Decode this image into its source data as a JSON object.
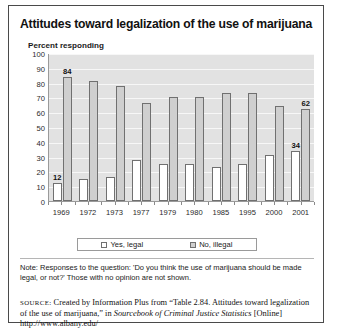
{
  "figure": {
    "title": "Attitudes toward legalization of the use of marijuana",
    "axis_title": "Percent responding",
    "note": "Note: Responses to the question: 'Do you think the use of marijuana should be made legal, or not?' Those with no opinion are not shown.",
    "source": {
      "label": "SOURCE:",
      "text_1": " Created by Information Plus from “Table 2.84. Attitudes toward legalization of the use of marijuana,” in ",
      "italic_1": "Sourcebook of Criminal Justice Statistics",
      "text_2": " [Online] http://www.albany.edu/"
    }
  },
  "legend": {
    "items": [
      {
        "label": "Yes, legal",
        "swatch": "white-square-icon",
        "color": "#ffffff"
      },
      {
        "label": "No, illegal",
        "swatch": "gray-square-icon",
        "color": "#cfcfcf"
      }
    ]
  },
  "chart_data": {
    "type": "bar",
    "title": "Attitudes toward legalization of the use of marijuana",
    "subtitle": "",
    "xlabel": "",
    "ylabel": "Percent responding",
    "ylim": [
      0,
      100
    ],
    "ytick_step": 10,
    "yticks": [
      0,
      10,
      20,
      30,
      40,
      50,
      60,
      70,
      80,
      90,
      100
    ],
    "grid": true,
    "legend_position": "bottom",
    "categories": [
      "1969",
      "1972",
      "1973",
      "1977",
      "1979",
      "1980",
      "1985",
      "1995",
      "2000",
      "2001"
    ],
    "series": [
      {
        "name": "Yes, legal",
        "color": "#ffffff",
        "values": [
          12,
          15,
          16,
          28,
          25,
          25,
          23,
          25,
          31,
          34
        ],
        "labels": [
          "12",
          "",
          "",
          "",
          "",
          "",
          "",
          "",
          "",
          "34"
        ]
      },
      {
        "name": "No, illegal",
        "color": "#cfcfcf",
        "values": [
          84,
          81,
          78,
          66,
          70,
          70,
          73,
          73,
          64,
          62
        ],
        "labels": [
          "84",
          "",
          "",
          "",
          "",
          "",
          "",
          "",
          "",
          "62"
        ]
      }
    ],
    "annotations": [
      "Note: Responses to the question: 'Do you think the use of marijuana should be made legal, or not?' Those with no opinion are not shown."
    ]
  }
}
